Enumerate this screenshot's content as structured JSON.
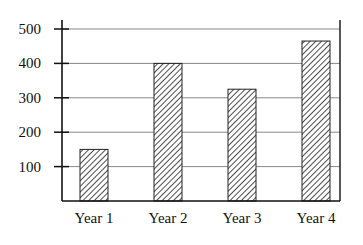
{
  "chart_data": {
    "type": "bar",
    "title": "",
    "xlabel": "",
    "ylabel": "",
    "categories": [
      "Year 1",
      "Year 2",
      "Year 3",
      "Year 4"
    ],
    "values": [
      150,
      400,
      325,
      465
    ],
    "ylim": [
      0,
      500
    ],
    "yticks": [
      100,
      200,
      300,
      400,
      500
    ],
    "grid": "horizontal",
    "legend": null,
    "bar_fill": "diagonal-hatch",
    "colors": {
      "axis": "#111111",
      "grid": "#888888",
      "hatch": "#222222",
      "background": "#ffffff"
    }
  }
}
